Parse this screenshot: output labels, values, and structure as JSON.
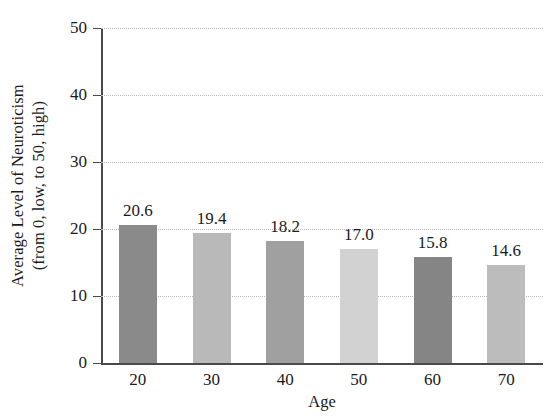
{
  "chart_data": {
    "type": "bar",
    "title": "",
    "subtitle": "",
    "xlabel": "Age",
    "ylabel": "Average Level of Neuroticism (from 0, low, to 50, high)",
    "ylabel_lines": [
      "Average Level of Neuroticism",
      "(from 0, low, to 50, high)"
    ],
    "categories": [
      "20",
      "30",
      "40",
      "50",
      "60",
      "70"
    ],
    "values": [
      20.6,
      19.4,
      18.2,
      17.0,
      15.8,
      14.6
    ],
    "data_labels": [
      "20.6",
      "19.4",
      "18.2",
      "17.0",
      "15.8",
      "14.6"
    ],
    "bar_colors": [
      "#8a8a8a",
      "#b9b9b9",
      "#a0a0a0",
      "#d2d2d2",
      "#858585",
      "#bcbcbc"
    ],
    "ylim": [
      0,
      50
    ],
    "yticks": [
      0,
      10,
      20,
      30,
      40,
      50
    ],
    "ytick_labels": [
      "0",
      "10",
      "20",
      "30",
      "40",
      "50"
    ],
    "xlim_categories": 6,
    "grid": "horizontal-dotted",
    "legend": "none",
    "axis_color": "#4a4a4a",
    "gridline_color": "#b5b5b5",
    "background": "#ffffff"
  }
}
